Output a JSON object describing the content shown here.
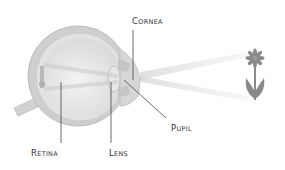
{
  "diagram": {
    "labels": {
      "cornea": "Cornea",
      "pupil": "Pupil",
      "retina": "Retina",
      "lens": "Lens"
    },
    "object": "flower",
    "colors": {
      "label_text": "#333333",
      "leader_line": "#444444",
      "eye_outer": "#c8c8c8",
      "eye_inner": "#e6e6e6",
      "light_rays": "#d9d9d9",
      "flower": "#8a8a8a"
    }
  }
}
